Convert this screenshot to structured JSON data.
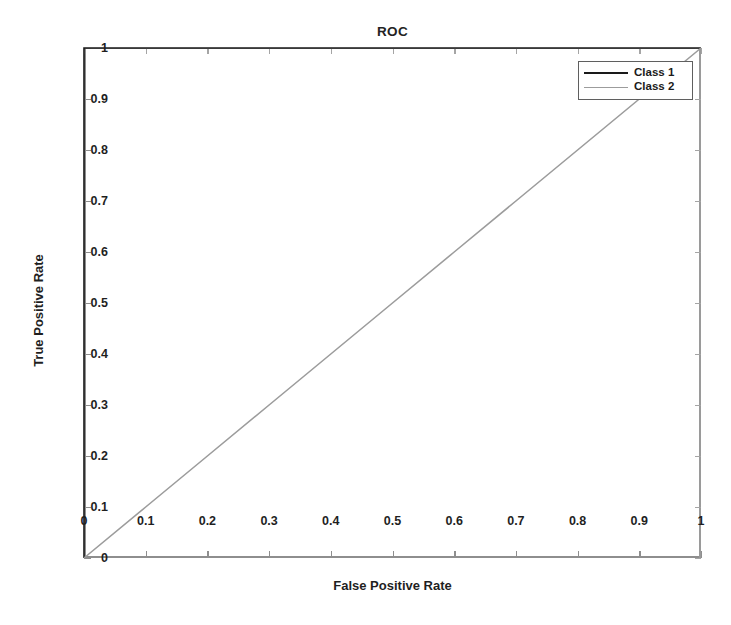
{
  "chart_data": {
    "type": "line",
    "title": "ROC",
    "xlabel": "False Positive Rate",
    "ylabel": "True Positive Rate",
    "xlim": [
      0,
      1
    ],
    "ylim": [
      0,
      1
    ],
    "grid": false,
    "legend_position": "top-right",
    "xticks": [
      "0",
      "0.1",
      "0.2",
      "0.3",
      "0.4",
      "0.5",
      "0.6",
      "0.7",
      "0.8",
      "0.9",
      "1"
    ],
    "xtick_values": [
      0,
      0.1,
      0.2,
      0.3,
      0.4,
      0.5,
      0.6,
      0.7,
      0.8,
      0.9,
      1
    ],
    "yticks": [
      "0",
      "0.1",
      "0.2",
      "0.3",
      "0.4",
      "0.5",
      "0.6",
      "0.7",
      "0.8",
      "0.9",
      "1"
    ],
    "ytick_values": [
      0,
      0.1,
      0.2,
      0.3,
      0.4,
      0.5,
      0.6,
      0.7,
      0.8,
      0.9,
      1
    ],
    "series": [
      {
        "name": "Class 1",
        "color": "#1a1a1a",
        "width": 1.6,
        "x": [
          0,
          0,
          0.1,
          0.2,
          0.3,
          0.4,
          0.5,
          0.6,
          0.7,
          0.8,
          0.9,
          1
        ],
        "y": [
          0,
          1,
          1,
          1,
          1,
          1,
          1,
          1,
          1,
          1,
          1,
          1
        ]
      },
      {
        "name": "Class 2",
        "color": "#9c9c9c",
        "width": 1.6,
        "x": [
          0,
          0.1,
          0.2,
          0.3,
          0.4,
          0.5,
          0.6,
          0.7,
          0.8,
          0.9,
          1
        ],
        "y": [
          0,
          0.1,
          0.2,
          0.3,
          0.4,
          0.5,
          0.6,
          0.7,
          0.8,
          0.9,
          1
        ]
      }
    ]
  },
  "legend": {
    "entries": [
      {
        "label": "Class 1"
      },
      {
        "label": "Class 2"
      }
    ]
  }
}
